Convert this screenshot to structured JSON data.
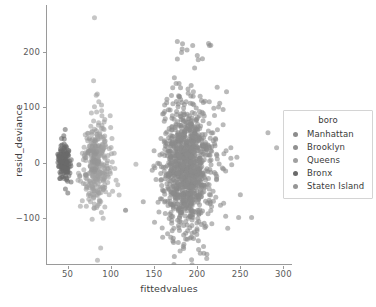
{
  "chart_data": {
    "type": "scatter",
    "title": "",
    "xlabel": "fittedvalues",
    "ylabel": "resid_deviance",
    "xlim": [
      25,
      310
    ],
    "ylim": [
      -185,
      285
    ],
    "xticks": [
      50,
      100,
      150,
      200,
      250,
      300
    ],
    "yticks": [
      -100,
      0,
      100,
      200
    ],
    "grid": false,
    "legend": {
      "title": "boro",
      "position": "right-outside",
      "entries": [
        {
          "label": "Manhattan",
          "color": "#8c8c8c"
        },
        {
          "label": "Brooklyn",
          "color": "#909090"
        },
        {
          "label": "Queens",
          "color": "#a0a0a0"
        },
        {
          "label": "Bronx",
          "color": "#6a6a6a"
        },
        {
          "label": "Staten Island",
          "color": "#969696"
        }
      ]
    },
    "marker": {
      "size": 5,
      "alpha": 0.6,
      "shape": "circle"
    },
    "series": [
      {
        "name": "Bronx",
        "color": "#6a6a6a",
        "n": 150,
        "cluster": {
          "x_center": 45,
          "x_spread": 3.2,
          "y_center": 2,
          "y_spread": 14,
          "seed": 11
        },
        "outliers": [
          [
            62,
            -4
          ],
          [
            75,
            -6
          ],
          [
            116,
            -86
          ]
        ]
      },
      {
        "name": "Queens",
        "color": "#a0a0a0",
        "n": 300,
        "cluster": {
          "x_center": 83,
          "x_spread": 7.5,
          "y_center": -5,
          "y_spread": 33,
          "seed": 23
        },
        "outliers": [
          [
            80,
            262
          ],
          [
            79,
            148
          ],
          [
            82,
            122
          ],
          [
            85,
            110
          ],
          [
            80,
            101
          ],
          [
            68,
            28
          ],
          [
            66,
            17
          ],
          [
            92,
            -80
          ],
          [
            107,
            -40
          ],
          [
            97,
            -58
          ],
          [
            128,
            -3
          ],
          [
            63,
            -23
          ],
          [
            90,
            -48
          ]
        ]
      },
      {
        "name": "Brooklyn",
        "color": "#8a8a8a",
        "n": 900,
        "cluster": {
          "x_center": 185,
          "x_spread": 13,
          "y_center": -12,
          "y_spread": 52,
          "seed": 37
        },
        "outliers": [
          [
            176,
            219
          ],
          [
            182,
            215
          ],
          [
            196,
            171
          ],
          [
            178,
            143
          ],
          [
            233,
            128
          ],
          [
            208,
            111
          ],
          [
            213,
            110
          ],
          [
            229,
            96
          ],
          [
            190,
            85
          ],
          [
            238,
            27
          ],
          [
            245,
            10
          ],
          [
            238,
            8
          ],
          [
            219,
            -18
          ],
          [
            232,
            -15
          ],
          [
            211,
            -73
          ],
          [
            226,
            -77
          ],
          [
            209,
            -115
          ],
          [
            232,
            -97
          ],
          [
            249,
            -58
          ],
          [
            159,
            -135
          ],
          [
            157,
            -32
          ],
          [
            239,
            -4
          ]
        ]
      },
      {
        "name": "Manhattan",
        "color": "#8c8c8c",
        "n": 220,
        "cluster": {
          "x_center": 196,
          "x_spread": 16,
          "y_center": 5,
          "y_spread": 48,
          "seed": 53
        },
        "outliers": [
          [
            281,
            54
          ],
          [
            291,
            27
          ],
          [
            262,
            -99
          ],
          [
            247,
            -99
          ]
        ]
      },
      {
        "name": "Staten Island",
        "color": "#969696",
        "n": 40,
        "cluster": {
          "x_center": 78,
          "x_spread": 5,
          "y_center": 10,
          "y_spread": 20,
          "seed": 71
        },
        "outliers": []
      }
    ]
  }
}
